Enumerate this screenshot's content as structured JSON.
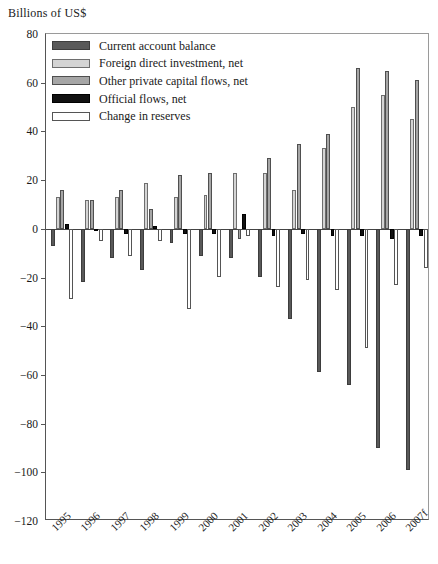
{
  "chart_data": {
    "type": "bar",
    "title": "",
    "subtitle": "",
    "ylabel": "Billions of US$",
    "xlabel": "",
    "ylim": [
      -120,
      80
    ],
    "yticks": [
      80,
      60,
      40,
      20,
      0,
      -20,
      -40,
      -60,
      -80,
      -100,
      -120
    ],
    "ytick_labels": [
      "80",
      "60",
      "40",
      "20",
      "0",
      "−20",
      "−40",
      "−60",
      "−80",
      "−100",
      "−120"
    ],
    "grid": false,
    "legend_position": "top-left",
    "categories": [
      "1995",
      "1996",
      "1997",
      "1998",
      "1999",
      "2000",
      "2001",
      "2002",
      "2003",
      "2004",
      "2005",
      "2006",
      "2007f"
    ],
    "series": [
      {
        "name": "Current account balance",
        "color": "#595959",
        "values": [
          -7,
          -22,
          -12,
          -17,
          -6,
          -11,
          -12,
          -20,
          -37,
          -59,
          -64,
          -90,
          -99
        ]
      },
      {
        "name": "Foreign direct investment, net",
        "color": "#d4d4d4",
        "values": [
          13,
          12,
          13,
          19,
          13,
          14,
          23,
          23,
          16,
          33,
          50,
          55,
          45
        ]
      },
      {
        "name": "Other private capital flows, net",
        "color": "#a6a6a6",
        "values": [
          16,
          12,
          16,
          8,
          22,
          23,
          -4,
          29,
          35,
          39,
          66,
          65,
          61
        ]
      },
      {
        "name": "Official flows, net",
        "color": "#111111",
        "values": [
          2,
          -1,
          -2,
          1,
          -2,
          -2,
          6,
          -3,
          -2,
          -3,
          -3,
          -4,
          -3
        ]
      },
      {
        "name": "Change in reserves",
        "color": "#ffffff",
        "values": [
          -29,
          -5,
          -11,
          -5,
          -33,
          -20,
          -3,
          -24,
          -21,
          -25,
          -49,
          -23,
          -16
        ]
      }
    ]
  },
  "axis": {
    "units_label": "Billions of US$"
  },
  "legend": {
    "items": [
      {
        "label": "Current account balance",
        "swatch": "legend-swatch-current-account"
      },
      {
        "label": "Foreign direct investment, net",
        "swatch": "legend-swatch-fdi"
      },
      {
        "label": "Other private capital flows, net",
        "swatch": "legend-swatch-other-private"
      },
      {
        "label": "Official flows, net",
        "swatch": "legend-swatch-official"
      },
      {
        "label": "Change in reserves",
        "swatch": "legend-swatch-reserves"
      }
    ]
  }
}
